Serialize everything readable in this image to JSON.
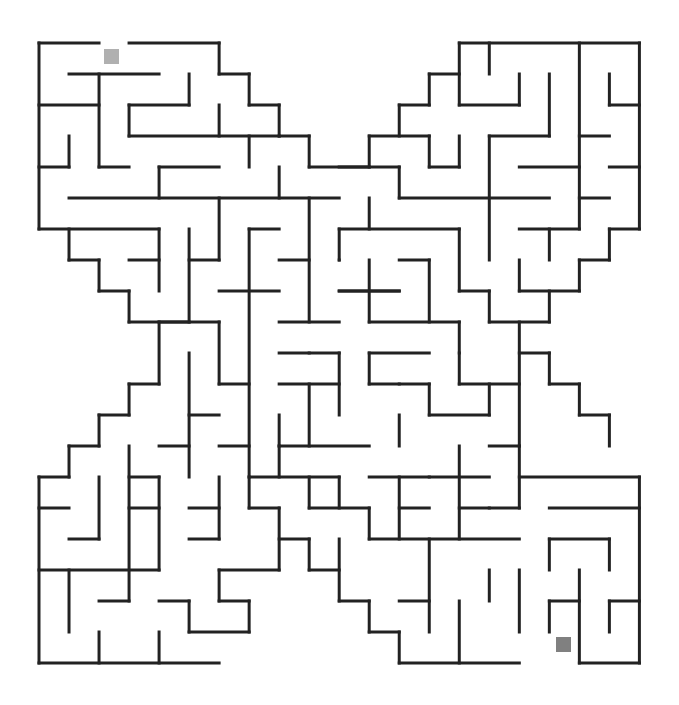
{
  "puzzle": {
    "type": "maze",
    "shape": "X",
    "grid": {
      "cols": 20,
      "rows": 20,
      "origin_x": 39,
      "origin_y": 43,
      "cell_w": 30.02,
      "cell_h": 31.0
    },
    "colors": {
      "wall": "#222222",
      "start": "#b0b0b0",
      "end": "#808080",
      "background": "#ffffff"
    },
    "start": {
      "x": 104,
      "y": 49,
      "size": 15
    },
    "end": {
      "x": 556,
      "y": 637,
      "size": 15
    },
    "walls": [
      [
        0,
        0,
        2,
        0
      ],
      [
        3,
        0,
        6,
        0
      ],
      [
        6,
        0,
        6,
        1
      ],
      [
        6,
        1,
        7,
        1
      ],
      [
        7,
        1,
        7,
        2
      ],
      [
        7,
        2,
        8,
        2
      ],
      [
        8,
        2,
        8,
        3
      ],
      [
        8,
        3,
        9,
        3
      ],
      [
        9,
        3,
        9,
        4
      ],
      [
        9,
        4,
        11,
        4
      ],
      [
        1,
        1,
        4,
        1
      ],
      [
        2,
        1,
        2,
        4
      ],
      [
        2,
        4,
        3,
        4
      ],
      [
        5,
        1,
        5,
        2
      ],
      [
        3,
        2,
        5,
        2
      ],
      [
        3,
        2,
        3,
        3
      ],
      [
        3,
        3,
        8,
        3
      ],
      [
        0,
        2,
        2,
        2
      ],
      [
        0,
        0,
        0,
        6
      ],
      [
        6,
        2,
        6,
        3
      ],
      [
        7,
        3,
        7,
        4
      ],
      [
        1,
        3,
        1,
        4
      ],
      [
        0,
        4,
        1,
        4
      ],
      [
        4,
        4,
        6,
        4
      ],
      [
        4,
        4,
        4,
        5
      ],
      [
        8,
        4,
        8,
        5
      ],
      [
        1,
        5,
        10,
        5
      ],
      [
        0,
        6,
        4,
        6
      ],
      [
        1,
        6,
        1,
        7
      ],
      [
        1,
        7,
        2,
        7
      ],
      [
        2,
        7,
        2,
        8
      ],
      [
        2,
        8,
        3,
        8
      ],
      [
        3,
        8,
        3,
        9
      ],
      [
        3,
        9,
        6,
        9
      ],
      [
        4,
        6,
        4,
        8
      ],
      [
        3,
        7,
        4,
        7
      ],
      [
        5,
        6,
        5,
        9
      ],
      [
        5,
        7,
        6,
        7
      ],
      [
        6,
        5,
        6,
        7
      ],
      [
        7,
        6,
        8,
        6
      ],
      [
        7,
        6,
        7,
        14
      ],
      [
        6,
        8,
        8,
        8
      ],
      [
        9,
        5,
        9,
        9
      ],
      [
        8,
        7,
        9,
        7
      ],
      [
        8,
        9,
        10,
        9
      ],
      [
        10,
        6,
        10,
        7
      ],
      [
        10,
        7,
        10,
        7
      ],
      [
        10,
        8,
        12,
        8
      ],
      [
        14,
        0,
        20,
        0
      ],
      [
        15,
        0,
        15,
        1
      ],
      [
        14,
        0,
        14,
        2
      ],
      [
        14,
        2,
        16,
        2
      ],
      [
        16,
        1,
        16,
        2
      ],
      [
        17,
        1,
        17,
        3
      ],
      [
        18,
        0,
        18,
        6
      ],
      [
        19,
        1,
        19,
        2
      ],
      [
        19,
        2,
        20,
        2
      ],
      [
        20,
        0,
        20,
        6
      ],
      [
        13,
        1,
        14,
        1
      ],
      [
        13,
        1,
        13,
        2
      ],
      [
        12,
        2,
        13,
        2
      ],
      [
        12,
        2,
        12,
        3
      ],
      [
        11,
        3,
        13,
        3
      ],
      [
        11,
        3,
        11,
        4
      ],
      [
        13,
        3,
        13,
        4
      ],
      [
        13,
        4,
        14,
        4
      ],
      [
        14,
        3,
        14,
        4
      ],
      [
        15,
        3,
        17,
        3
      ],
      [
        15,
        3,
        15,
        7
      ],
      [
        18,
        3,
        19,
        3
      ],
      [
        16,
        4,
        18,
        4
      ],
      [
        19,
        4,
        20,
        4
      ],
      [
        10,
        4,
        12,
        4
      ],
      [
        12,
        4,
        12,
        5
      ],
      [
        12,
        5,
        17,
        5
      ],
      [
        18,
        5,
        19,
        5
      ],
      [
        11,
        5,
        11,
        6
      ],
      [
        10,
        6,
        14,
        6
      ],
      [
        14,
        6,
        14,
        8
      ],
      [
        16,
        6,
        18,
        6
      ],
      [
        17,
        6,
        17,
        7
      ],
      [
        19,
        6,
        20,
        6
      ],
      [
        19,
        6,
        19,
        7
      ],
      [
        18,
        7,
        19,
        7
      ],
      [
        18,
        7,
        18,
        8
      ],
      [
        16,
        8,
        18,
        8
      ],
      [
        16,
        7,
        16,
        8
      ],
      [
        17,
        8,
        17,
        9
      ],
      [
        15,
        9,
        17,
        9
      ],
      [
        15,
        8,
        15,
        9
      ],
      [
        14,
        8,
        15,
        8
      ],
      [
        16,
        9,
        16,
        13
      ],
      [
        11,
        7,
        11,
        9
      ],
      [
        12,
        7,
        13,
        7
      ],
      [
        13,
        7,
        13,
        9
      ],
      [
        10,
        8,
        12,
        8
      ],
      [
        11,
        9,
        14,
        9
      ],
      [
        14,
        9,
        14,
        10
      ],
      [
        9,
        10,
        10,
        10
      ],
      [
        10,
        10,
        10,
        12
      ],
      [
        8,
        10,
        9,
        10
      ],
      [
        8,
        11,
        10,
        11
      ],
      [
        8,
        12,
        8,
        13
      ],
      [
        8,
        13,
        11,
        13
      ],
      [
        9,
        11,
        9,
        13
      ],
      [
        11,
        10,
        13,
        10
      ],
      [
        11,
        10,
        11,
        11
      ],
      [
        12,
        11,
        13,
        11
      ],
      [
        13,
        11,
        13,
        12
      ],
      [
        13,
        12,
        15,
        12
      ],
      [
        15,
        11,
        15,
        12
      ],
      [
        12,
        12,
        12,
        13
      ],
      [
        11,
        11,
        12,
        11
      ],
      [
        14,
        10,
        14,
        11
      ],
      [
        14,
        11,
        16,
        11
      ],
      [
        16,
        10,
        17,
        10
      ],
      [
        17,
        10,
        17,
        11
      ],
      [
        17,
        11,
        18,
        11
      ],
      [
        18,
        11,
        18,
        12
      ],
      [
        18,
        12,
        19,
        12
      ],
      [
        19,
        12,
        19,
        13
      ],
      [
        6,
        9,
        6,
        11
      ],
      [
        4,
        9,
        5,
        9
      ],
      [
        4,
        9,
        4,
        11
      ],
      [
        3,
        11,
        4,
        11
      ],
      [
        5,
        10,
        5,
        14
      ],
      [
        5,
        12,
        6,
        12
      ],
      [
        6,
        11,
        7,
        11
      ],
      [
        6,
        13,
        7,
        13
      ],
      [
        3,
        11,
        3,
        12
      ],
      [
        2,
        12,
        3,
        12
      ],
      [
        2,
        12,
        2,
        13
      ],
      [
        1,
        13,
        2,
        13
      ],
      [
        1,
        13,
        1,
        14
      ],
      [
        0,
        14,
        1,
        14
      ],
      [
        0,
        14,
        0,
        20
      ],
      [
        0,
        15,
        1,
        15
      ],
      [
        2,
        14,
        2,
        16
      ],
      [
        1,
        16,
        2,
        16
      ],
      [
        3,
        13,
        3,
        18
      ],
      [
        3,
        14,
        4,
        14
      ],
      [
        3,
        15,
        4,
        15
      ],
      [
        4,
        13,
        5,
        13
      ],
      [
        4,
        14,
        4,
        17
      ],
      [
        0,
        17,
        4,
        17
      ],
      [
        1,
        17,
        1,
        19
      ],
      [
        2,
        18,
        3,
        18
      ],
      [
        2,
        19,
        2,
        20
      ],
      [
        0,
        20,
        6,
        20
      ],
      [
        4,
        19,
        4,
        20
      ],
      [
        4,
        18,
        5,
        18
      ],
      [
        5,
        18,
        5,
        19
      ],
      [
        5,
        19,
        7,
        19
      ],
      [
        7,
        18,
        7,
        19
      ],
      [
        6,
        14,
        6,
        16
      ],
      [
        5,
        16,
        6,
        16
      ],
      [
        5,
        15,
        6,
        15
      ],
      [
        6,
        17,
        8,
        17
      ],
      [
        6,
        17,
        6,
        18
      ],
      [
        8,
        15,
        8,
        17
      ],
      [
        7,
        14,
        7,
        15
      ],
      [
        7,
        15,
        8,
        15
      ],
      [
        6,
        18,
        7,
        18
      ],
      [
        8,
        13,
        8,
        14
      ],
      [
        7,
        14,
        10,
        14
      ],
      [
        9,
        14,
        9,
        15
      ],
      [
        9,
        15,
        11,
        15
      ],
      [
        11,
        15,
        11,
        16
      ],
      [
        11,
        16,
        16,
        16
      ],
      [
        10,
        14,
        10,
        15
      ],
      [
        8,
        16,
        9,
        16
      ],
      [
        9,
        16,
        9,
        17
      ],
      [
        9,
        17,
        10,
        17
      ],
      [
        10,
        16,
        10,
        18
      ],
      [
        10,
        18,
        11,
        18
      ],
      [
        11,
        18,
        11,
        19
      ],
      [
        11,
        19,
        12,
        19
      ],
      [
        12,
        19,
        12,
        20
      ],
      [
        12,
        20,
        16,
        20
      ],
      [
        11,
        14,
        13,
        14
      ],
      [
        12,
        14,
        12,
        16
      ],
      [
        12,
        15,
        13,
        15
      ],
      [
        14,
        13,
        14,
        16
      ],
      [
        13,
        14,
        15,
        14
      ],
      [
        14,
        15,
        15,
        15
      ],
      [
        15,
        13,
        16,
        13
      ],
      [
        16,
        13,
        16,
        15
      ],
      [
        15,
        15,
        16,
        15
      ],
      [
        16,
        14,
        20,
        14
      ],
      [
        17,
        15,
        20,
        15
      ],
      [
        20,
        14,
        20,
        20
      ],
      [
        17,
        16,
        19,
        16
      ],
      [
        17,
        16,
        17,
        17
      ],
      [
        19,
        16,
        19,
        17
      ],
      [
        18,
        17,
        18,
        20
      ],
      [
        18,
        20,
        20,
        20
      ],
      [
        17,
        18,
        18,
        18
      ],
      [
        17,
        18,
        17,
        19
      ],
      [
        19,
        18,
        20,
        18
      ],
      [
        19,
        18,
        19,
        19
      ],
      [
        13,
        16,
        13,
        19
      ],
      [
        12,
        18,
        13,
        18
      ],
      [
        14,
        18,
        14,
        20
      ],
      [
        15,
        17,
        15,
        18
      ],
      [
        16,
        17,
        16,
        19
      ]
    ]
  }
}
